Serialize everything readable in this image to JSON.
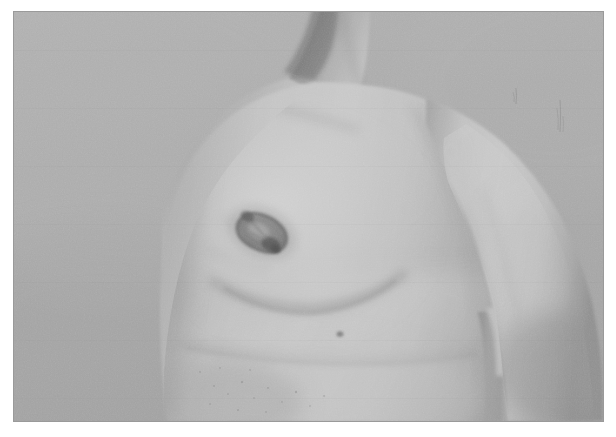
{
  "page": {
    "background_color": "#ffffff",
    "width": 616,
    "height": 437
  },
  "photograph": {
    "name": "clinical-photograph",
    "caption": "",
    "alt_text": "Grayscale clinical photograph of a male torso in three-quarter oblique view showing the chest, left breast with an irregular nipple-areolar lesion, the abdomen, and the arm hanging at the side against a plain gray studio backdrop.",
    "frame": {
      "x": 14,
      "y": 12,
      "width": 589,
      "height": 409
    },
    "color_mode": "grayscale",
    "background_color": "#a9a9a9",
    "border_color": "#9a9a9a",
    "palette": {
      "backdrop": "#aaaaaa",
      "skin_highlight": "#cfcfcf",
      "skin_midtone": "#b6b6b6",
      "skin_shadow": "#8f8f8f",
      "deep_shadow": "#6e6e6e",
      "lesion_dark": "#5c5c5c",
      "lesion_mid": "#7d7d7d"
    },
    "regions": [
      {
        "label": "studio-backdrop",
        "position": "left and upper-right fill"
      },
      {
        "label": "neck",
        "position": "top center"
      },
      {
        "label": "right-shoulder",
        "position": "upper left of body"
      },
      {
        "label": "chest-sternum",
        "position": "upper center"
      },
      {
        "label": "left-breast",
        "position": "center"
      },
      {
        "label": "nipple-areolar-lesion",
        "position": "center, x≈248 y≈220 in frame"
      },
      {
        "label": "abdomen",
        "position": "lower center"
      },
      {
        "label": "flank-fold",
        "position": "lower center-right"
      },
      {
        "label": "left-arm",
        "position": "right side, hanging down"
      },
      {
        "label": "axillary-gap",
        "position": "right, between arm and torso"
      }
    ],
    "findings": [
      {
        "name": "nipple-areolar-lesion",
        "description": "irregular oval ulcerated / crusted lesion replacing the nipple-areolar complex",
        "approx_size_px": 44
      },
      {
        "name": "inframammary-fold",
        "description": "curved shadow beneath the breast"
      },
      {
        "name": "skin-nevus",
        "description": "small dark punctate mark below the breast"
      }
    ]
  }
}
